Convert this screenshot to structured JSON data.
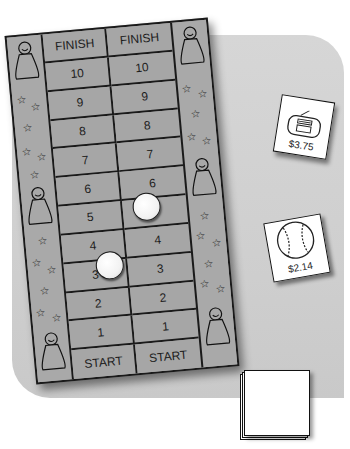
{
  "board": {
    "columns": [
      {
        "cells": [
          "FINISH",
          "10",
          "9",
          "8",
          "7",
          "6",
          "5",
          "4",
          "3",
          "2",
          "1",
          "START"
        ]
      },
      {
        "cells": [
          "FINISH",
          "10",
          "9",
          "8",
          "7",
          "6",
          "5",
          "4",
          "3",
          "2",
          "1",
          "START"
        ]
      }
    ],
    "pieces": [
      {
        "column": 2,
        "space": "5"
      },
      {
        "column": 1,
        "space": "3"
      }
    ],
    "colors": {
      "board": "#a8a8a8",
      "lines": "#1a1a1a",
      "table": "#d0d0d0"
    }
  },
  "cards": [
    {
      "icon": "boombox-icon",
      "price": "$3.75"
    },
    {
      "icon": "baseball-icon",
      "price": "$2.14"
    }
  ],
  "deck": {
    "label": ""
  }
}
